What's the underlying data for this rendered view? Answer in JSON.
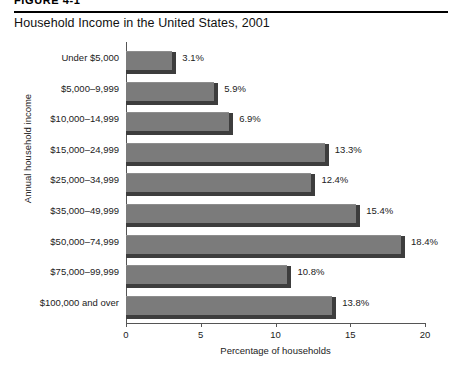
{
  "figure": {
    "header": "FIGURE 4-1",
    "title": "Household Income in the United States, 2001"
  },
  "chart_data": {
    "type": "bar",
    "orientation": "horizontal",
    "title": "Household Income in the United States, 2001",
    "xlabel": "Percentage of households",
    "ylabel": "Annual household income",
    "xlim": [
      0,
      20
    ],
    "xticks": [
      0,
      5,
      10,
      15,
      20
    ],
    "xtick_labels": [
      "0",
      "5",
      "10",
      "15",
      "20"
    ],
    "grid": false,
    "legend": null,
    "bar_color": "#7b7b7b",
    "bar_shadow_color": "#3d3d3d",
    "categories": [
      "Under $5,000",
      "$5,000–9,999",
      "$10,000–14,999",
      "$15,000–24,999",
      "$25,000–34,999",
      "$35,000–49,999",
      "$50,000–74,999",
      "$75,000–99,999",
      "$100,000 and over"
    ],
    "values": [
      3.1,
      5.9,
      6.9,
      13.3,
      12.4,
      15.4,
      18.4,
      10.8,
      13.8
    ],
    "data_labels": [
      "3.1%",
      "5.9%",
      "6.9%",
      "13.3%",
      "12.4%",
      "15.4%",
      "18.4%",
      "10.8%",
      "13.8%"
    ]
  }
}
